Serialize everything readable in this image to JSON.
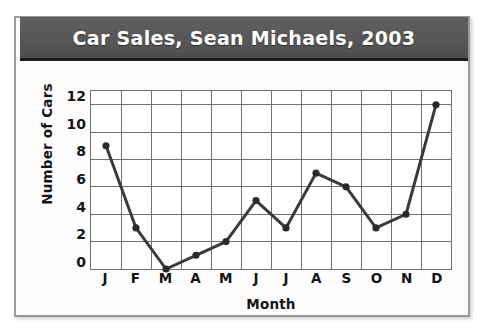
{
  "figure": {
    "title": "Car Sales, Sean Michaels, 2003",
    "banner_color": "#575757",
    "banner_text_color": "#ffffff",
    "frame_color": "#9a9a9a",
    "background_color": "#ffffff"
  },
  "chart_data": {
    "type": "line",
    "title": "Car Sales, Sean Michaels, 2003",
    "xlabel": "Month",
    "ylabel": "Number of Cars",
    "categories": [
      "J",
      "F",
      "M",
      "A",
      "M",
      "J",
      "J",
      "A",
      "S",
      "O",
      "N",
      "D"
    ],
    "category_full_names": [
      "January",
      "February",
      "March",
      "April",
      "May",
      "June",
      "July",
      "August",
      "September",
      "October",
      "November",
      "December"
    ],
    "values": [
      9,
      3,
      0,
      1,
      2,
      5,
      3,
      7,
      6,
      3,
      4,
      12
    ],
    "ylim": [
      0,
      13
    ],
    "xlim": [
      0,
      13
    ],
    "ytick_labels": [
      "0",
      "2",
      "4",
      "6",
      "8",
      "10",
      "12"
    ],
    "ytick_values": [
      0,
      2,
      4,
      6,
      8,
      10,
      12
    ],
    "grid": true,
    "grid_color": "#6f6f6f",
    "legend": false,
    "line_color": "#3a3a3a",
    "marker": "circle",
    "marker_color": "#2a2a2a"
  }
}
